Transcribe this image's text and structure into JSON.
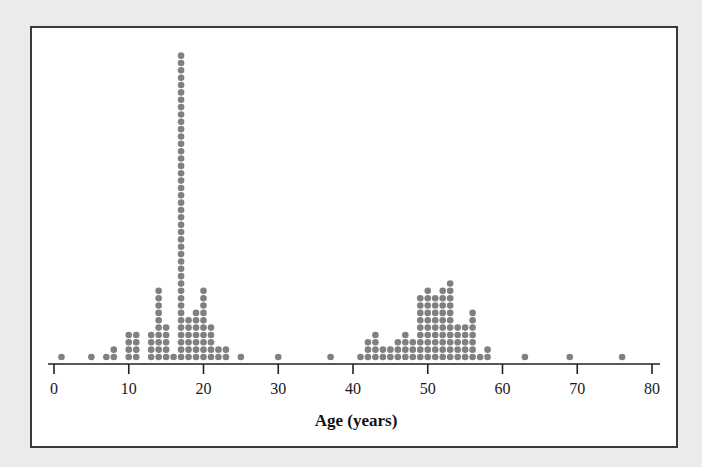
{
  "chart_data": {
    "type": "dotplot",
    "title": "",
    "xlabel": "Age (years)",
    "ylabel": "",
    "xlim": [
      0,
      80
    ],
    "x_ticks": [
      0,
      10,
      20,
      30,
      40,
      50,
      60,
      70,
      80
    ],
    "x_tick_labels": [
      "0",
      "10",
      "20",
      "30",
      "40",
      "50",
      "60",
      "70",
      "80"
    ],
    "grid": false,
    "legend": "none",
    "dot_color": "#808080",
    "points": [
      {
        "age": 1,
        "count": 1
      },
      {
        "age": 5,
        "count": 1
      },
      {
        "age": 7,
        "count": 1
      },
      {
        "age": 8,
        "count": 2
      },
      {
        "age": 10,
        "count": 4
      },
      {
        "age": 11,
        "count": 4
      },
      {
        "age": 13,
        "count": 4
      },
      {
        "age": 14,
        "count": 10
      },
      {
        "age": 15,
        "count": 5
      },
      {
        "age": 16,
        "count": 1
      },
      {
        "age": 17,
        "count": 42
      },
      {
        "age": 18,
        "count": 6
      },
      {
        "age": 19,
        "count": 7
      },
      {
        "age": 20,
        "count": 10
      },
      {
        "age": 21,
        "count": 5
      },
      {
        "age": 22,
        "count": 2
      },
      {
        "age": 23,
        "count": 2
      },
      {
        "age": 25,
        "count": 1
      },
      {
        "age": 30,
        "count": 1
      },
      {
        "age": 37,
        "count": 1
      },
      {
        "age": 41,
        "count": 1
      },
      {
        "age": 42,
        "count": 3
      },
      {
        "age": 43,
        "count": 4
      },
      {
        "age": 44,
        "count": 2
      },
      {
        "age": 45,
        "count": 2
      },
      {
        "age": 46,
        "count": 3
      },
      {
        "age": 47,
        "count": 4
      },
      {
        "age": 48,
        "count": 3
      },
      {
        "age": 49,
        "count": 9
      },
      {
        "age": 50,
        "count": 10
      },
      {
        "age": 51,
        "count": 9
      },
      {
        "age": 52,
        "count": 10
      },
      {
        "age": 53,
        "count": 11
      },
      {
        "age": 54,
        "count": 5
      },
      {
        "age": 55,
        "count": 5
      },
      {
        "age": 56,
        "count": 7
      },
      {
        "age": 57,
        "count": 1
      },
      {
        "age": 58,
        "count": 2
      },
      {
        "age": 63,
        "count": 1
      },
      {
        "age": 69,
        "count": 1
      },
      {
        "age": 76,
        "count": 1
      }
    ]
  }
}
